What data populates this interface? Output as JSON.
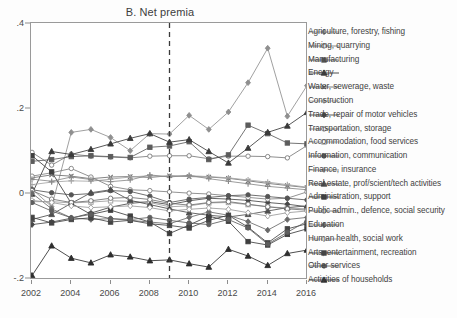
{
  "chart_data": {
    "type": "line",
    "title": "B. Net premia",
    "xlabel": "",
    "ylabel": "",
    "xlim": [
      2002,
      2016
    ],
    "ylim": [
      -0.2,
      0.4
    ],
    "grid": false,
    "legend_position": "right",
    "x_ticks": [
      "2002",
      "2004",
      "2006",
      "2008",
      "2010",
      "2012",
      "2014",
      "2016"
    ],
    "x_tick_values": [
      2002,
      2004,
      2006,
      2008,
      2010,
      2012,
      2014,
      2016
    ],
    "y_ticks": [
      ".4",
      ".2",
      "0",
      "-.2"
    ],
    "y_tick_values": [
      0.4,
      0.2,
      0,
      -0.2
    ],
    "annotations": [
      {
        "type": "vline",
        "x": 2009,
        "style": "dashed",
        "label": ""
      }
    ],
    "x": [
      2002,
      2003,
      2004,
      2005,
      2006,
      2007,
      2008,
      2009,
      2010,
      2011,
      2012,
      2013,
      2014,
      2015,
      2016
    ],
    "series": [
      {
        "name": "Agriculture, forestry, fishing",
        "color": "#8f8f8f",
        "marker": "diamond",
        "values": [
          0.012,
          -0.03,
          0.145,
          0.152,
          0.133,
          0.102,
          0.142,
          0.141,
          0.185,
          0.152,
          0.193,
          0.262,
          0.343,
          0.183,
          0.255
        ]
      },
      {
        "name": "Mining, quarrying",
        "color": "#7a7a7a",
        "marker": "circle-open",
        "values": [
          0.098,
          0.068,
          0.094,
          0.089,
          0.087,
          0.085,
          0.089,
          0.09,
          0.09,
          0.083,
          0.089,
          0.089,
          0.088,
          0.085,
          0.114
        ]
      },
      {
        "name": "Manufacturing",
        "color": "#5c5c5c",
        "marker": "square",
        "values": [
          0.077,
          0.081,
          0.088,
          0.09,
          0.088,
          0.086,
          0.11,
          0.113,
          0.123,
          0.081,
          0.092,
          0.162,
          0.142,
          0.12,
          0.118
        ]
      },
      {
        "name": "Energy",
        "color": "#3a3a3a",
        "marker": "triangle",
        "values": [
          0.0,
          0.1,
          0.093,
          0.105,
          0.118,
          0.131,
          0.142,
          0.122,
          0.128,
          0.1,
          0.073,
          0.108,
          0.145,
          0.16,
          0.192
        ]
      },
      {
        "name": "Water, sewerage, waste",
        "color": "#6e6e6e",
        "marker": "x",
        "values": [
          0.038,
          0.045,
          0.042,
          0.036,
          0.04,
          0.041,
          0.039,
          0.043,
          0.041,
          0.04,
          0.037,
          0.031,
          0.025,
          0.02,
          0.015
        ]
      },
      {
        "name": "Construction",
        "color": "#a5a5a5",
        "marker": "plus",
        "values": [
          0.022,
          0.028,
          0.031,
          0.03,
          0.035,
          0.04,
          0.043,
          0.041,
          0.043,
          0.041,
          0.038,
          0.033,
          0.028,
          0.022,
          0.016
        ]
      },
      {
        "name": "Trade, repair of motor vehicles",
        "color": "#474747",
        "marker": "diamond-solid",
        "values": [
          -0.072,
          -0.066,
          -0.057,
          -0.045,
          -0.031,
          -0.022,
          -0.018,
          -0.025,
          -0.016,
          -0.01,
          -0.012,
          -0.015,
          -0.02,
          -0.024,
          -0.03
        ]
      },
      {
        "name": "Transportation, storage",
        "color": "#808080",
        "marker": "circle-open",
        "values": [
          0.042,
          0.05,
          0.06,
          0.04,
          0.018,
          0.01,
          0.008,
          0.005,
          0.002,
          0.0,
          -0.004,
          -0.008,
          -0.012,
          -0.01,
          0.005
        ]
      },
      {
        "name": "Accommodation, food services",
        "color": "#9c9c9c",
        "marker": "square-open",
        "values": [
          -0.018,
          -0.018,
          -0.021,
          -0.019,
          -0.016,
          -0.017,
          -0.02,
          -0.03,
          -0.028,
          -0.021,
          -0.02,
          -0.025,
          -0.03,
          -0.033,
          -0.035
        ]
      },
      {
        "name": "Information, communication",
        "color": "#555555",
        "marker": "circle",
        "values": [
          0.01,
          0.003,
          -0.002,
          0.001,
          0.008,
          0.006,
          -0.005,
          -0.02,
          -0.012,
          -0.008,
          -0.004,
          -0.002,
          -0.006,
          -0.01,
          -0.014
        ]
      },
      {
        "name": "Finance, insurance",
        "color": "#8a8a8a",
        "marker": "plus",
        "values": [
          0.035,
          0.03,
          0.04,
          0.034,
          0.029,
          0.033,
          0.045,
          0.04,
          0.044,
          0.036,
          0.03,
          0.024,
          0.018,
          0.014,
          0.01
        ]
      },
      {
        "name": "Real estate, prof/scient/tech activities",
        "color": "#4f4f4f",
        "marker": "triangle",
        "values": [
          -0.06,
          -0.048,
          -0.022,
          0.003,
          0.01,
          -0.015,
          -0.025,
          -0.035,
          -0.044,
          -0.05,
          -0.054,
          -0.048,
          -0.04,
          -0.032,
          -0.028
        ]
      },
      {
        "name": "Administration, support",
        "color": "#3f3f3f",
        "marker": "square-solid",
        "values": [
          0.09,
          0.052,
          -0.022,
          -0.048,
          -0.038,
          -0.052,
          -0.066,
          -0.093,
          -0.073,
          -0.052,
          -0.064,
          -0.112,
          -0.12,
          -0.095,
          -0.082
        ]
      },
      {
        "name": "Public admin., defence, social security",
        "color": "#707070",
        "marker": "circle-open",
        "values": [
          0.008,
          -0.012,
          -0.02,
          -0.016,
          -0.01,
          -0.008,
          -0.013,
          -0.022,
          -0.026,
          -0.02,
          -0.018,
          -0.024,
          -0.03,
          -0.035,
          -0.038
        ]
      },
      {
        "name": "Education",
        "color": "#6a6a6a",
        "marker": "diamond",
        "values": [
          0.002,
          -0.035,
          -0.056,
          -0.06,
          -0.058,
          -0.062,
          -0.066,
          -0.07,
          -0.055,
          -0.042,
          -0.05,
          -0.065,
          -0.085,
          -0.06,
          -0.055
        ]
      },
      {
        "name": "Human health, social work",
        "color": "#9a9a9a",
        "marker": "diamond-open",
        "values": [
          -0.015,
          -0.02,
          -0.028,
          -0.032,
          -0.03,
          -0.028,
          -0.032,
          -0.04,
          -0.036,
          -0.033,
          -0.036,
          -0.044,
          -0.052,
          -0.044,
          -0.04
        ]
      },
      {
        "name": "Arts, entertainment, recreation",
        "color": "#444444",
        "marker": "square",
        "values": [
          -0.055,
          -0.068,
          -0.06,
          -0.056,
          -0.066,
          -0.062,
          -0.07,
          -0.074,
          -0.08,
          -0.062,
          -0.05,
          -0.078,
          -0.115,
          -0.082,
          -0.07
        ]
      },
      {
        "name": "Other services",
        "color": "#5e5e5e",
        "marker": "circle",
        "values": [
          -0.02,
          -0.04,
          -0.056,
          -0.048,
          -0.058,
          -0.06,
          -0.055,
          -0.062,
          -0.068,
          -0.072,
          -0.06,
          -0.08,
          -0.118,
          -0.09,
          -0.064
        ]
      },
      {
        "name": "Activities of households",
        "color": "#2e2e2e",
        "marker": "triangle",
        "values": [
          -0.192,
          -0.122,
          -0.151,
          -0.162,
          -0.143,
          -0.148,
          -0.157,
          -0.155,
          -0.164,
          -0.172,
          -0.13,
          -0.146,
          -0.168,
          -0.14,
          -0.132
        ]
      }
    ]
  },
  "caption": {
    "text": ""
  }
}
